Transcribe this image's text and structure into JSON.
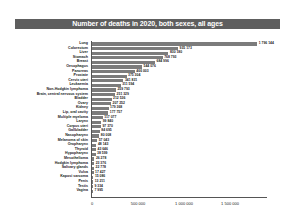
{
  "chart_data": {
    "type": "bar",
    "orientation": "horizontal",
    "title": "Number of deaths in 2020, both sexes, all ages",
    "xlabel": "",
    "ylabel": "",
    "xlim": [
      0,
      1900000
    ],
    "x_ticks": [
      "0",
      "500 000",
      "1 000 000",
      "1 500 000"
    ],
    "x_tick_values": [
      0,
      500000,
      1000000,
      1500000
    ],
    "grid": false,
    "legend": null,
    "categories": [
      "Lung",
      "Colorectum",
      "Liver",
      "Stomach",
      "Breast",
      "Oesophagus",
      "Pancreas",
      "Prostate",
      "Cervix uteri",
      "Leukaemia",
      "Non-Hodgkin lymphoma",
      "Brain, central nervous system",
      "Bladder",
      "Ovary",
      "Kidney",
      "Lip, oral cavity",
      "Multiple myeloma",
      "Larynx",
      "Corpus uteri",
      "Gallbladder",
      "Nasopharynx",
      "Melanoma of skin",
      "Oropharynx",
      "Thyroid",
      "Hypopharynx",
      "Mesothelioma",
      "Hodgkin lymphoma",
      "Salivary glands",
      "Vulva",
      "Kaposi sarcoma",
      "Penis",
      "Testis",
      "Vagina"
    ],
    "values": [
      1796144,
      935173,
      830180,
      768793,
      684996,
      544076,
      466003,
      375304,
      341831,
      311594,
      259793,
      251329,
      212536,
      207252,
      179368,
      177757,
      117077,
      99840,
      97370,
      84695,
      80008,
      57043,
      48143,
      43646,
      38599,
      26278,
      23376,
      22778,
      17427,
      15086,
      13211,
      9334,
      7995
    ],
    "value_labels": [
      "1 796 144",
      "935 173",
      "830 180",
      "768 793",
      "684 996",
      "544 076",
      "466 003",
      "375 304",
      "341 831",
      "311 594",
      "259 793",
      "251 329",
      "212 536",
      "207 252",
      "179 368",
      "177 757",
      "117 077",
      "99 840",
      "97 370",
      "84 695",
      "80 008",
      "57 043",
      "48 143",
      "43 646",
      "38 599",
      "26 278",
      "23 376",
      "22 778",
      "17 427",
      "15 086",
      "13 211",
      "9 334",
      "7 995"
    ],
    "colors": {
      "bar": "#7c7c7c",
      "title_band": "#5e5e5e",
      "title_text": "#ffffff"
    }
  }
}
